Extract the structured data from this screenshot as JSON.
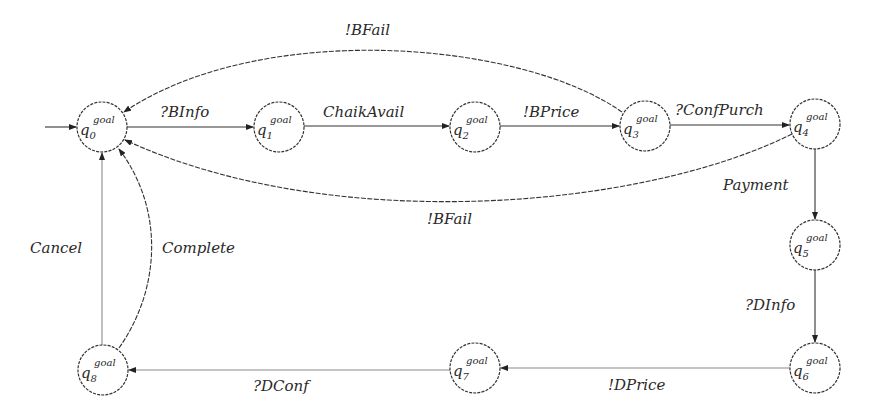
{
  "diagram": {
    "type": "state-machine",
    "states": [
      {
        "id": "q0",
        "base": "q",
        "sub": "0",
        "sup": "goal",
        "cx": 102,
        "cy": 127,
        "initial": true
      },
      {
        "id": "q1",
        "base": "q",
        "sub": "1",
        "sup": "goal",
        "cx": 279,
        "cy": 127
      },
      {
        "id": "q2",
        "base": "q",
        "sub": "2",
        "sup": "goal",
        "cx": 475,
        "cy": 127
      },
      {
        "id": "q3",
        "base": "q",
        "sub": "3",
        "sup": "goal",
        "cx": 645,
        "cy": 126
      },
      {
        "id": "q4",
        "base": "q",
        "sub": "4",
        "sup": "goal",
        "cx": 815,
        "cy": 124
      },
      {
        "id": "q5",
        "base": "q",
        "sub": "5",
        "sup": "goal",
        "cx": 815,
        "cy": 245
      },
      {
        "id": "q6",
        "base": "q",
        "sub": "6",
        "sup": "goal",
        "cx": 815,
        "cy": 368
      },
      {
        "id": "q7",
        "base": "q",
        "sub": "7",
        "sup": "goal",
        "cx": 475,
        "cy": 368
      },
      {
        "id": "q8",
        "base": "q",
        "sub": "8",
        "sup": "goal",
        "cx": 103,
        "cy": 370
      }
    ],
    "transitions": [
      {
        "from": "q0",
        "to": "q1",
        "label": "?BInfo"
      },
      {
        "from": "q1",
        "to": "q2",
        "label": "ChaikAvail"
      },
      {
        "from": "q2",
        "to": "q3",
        "label": "!BPrice"
      },
      {
        "from": "q3",
        "to": "q4",
        "label": "?ConfPurch"
      },
      {
        "from": "q3",
        "to": "q0",
        "label": "!BFail"
      },
      {
        "from": "q4",
        "to": "q0",
        "label": "!BFail"
      },
      {
        "from": "q4",
        "to": "q5",
        "label": "Payment"
      },
      {
        "from": "q5",
        "to": "q6",
        "label": "?DInfo"
      },
      {
        "from": "q6",
        "to": "q7",
        "label": "!DPrice"
      },
      {
        "from": "q7",
        "to": "q8",
        "label": "?DConf"
      },
      {
        "from": "q8",
        "to": "q0",
        "label": "Cancel"
      },
      {
        "from": "q8",
        "to": "q0",
        "label": "Complete"
      }
    ]
  },
  "labels": {
    "binfo": "?BInfo",
    "chaikavail": "ChaikAvail",
    "bprice": "!BPrice",
    "confpurch": "?ConfPurch",
    "bfail_top": "!BFail",
    "bfail_bottom": "!BFail",
    "payment": "Payment",
    "dinfo": "?DInfo",
    "dprice": "!DPrice",
    "dconf": "?DConf",
    "cancel": "Cancel",
    "complete": "Complete"
  },
  "state_text": {
    "base": "q",
    "sup": "goal",
    "subs": [
      "0",
      "1",
      "2",
      "3",
      "4",
      "5",
      "6",
      "7",
      "8"
    ]
  }
}
